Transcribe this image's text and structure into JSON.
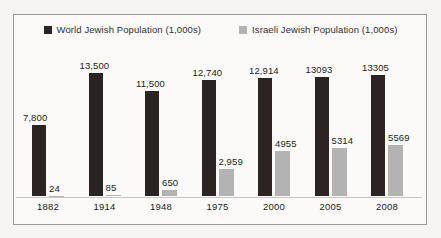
{
  "chart_data": {
    "type": "bar",
    "title": "",
    "xlabel": "",
    "ylabel": "",
    "grid": false,
    "legend_position": "top-center",
    "categories": [
      "1882",
      "1914",
      "1948",
      "1975",
      "2000",
      "2005",
      "2008"
    ],
    "ylim": [
      0,
      13500
    ],
    "series": [
      {
        "name": "World Jewish Population (1,000s)",
        "color": "#2b2422",
        "values": [
          7800,
          13500,
          11500,
          12740,
          12914,
          13093,
          13305
        ],
        "labels": [
          "7,800",
          "13,500",
          "11,500",
          "12,740",
          "12,914",
          "13093",
          "13305"
        ]
      },
      {
        "name": "Israeli Jewish Population (1,000s)",
        "color": "#b3b3b3",
        "values": [
          24,
          85,
          650,
          2959,
          4955,
          5314,
          5569
        ],
        "labels": [
          "24",
          "85",
          "650",
          "2,959",
          "4955",
          "5314",
          "5569"
        ]
      }
    ]
  },
  "legend": {
    "items": [
      {
        "label": "World Jewish Population (1,000s)",
        "swatch": "#2b2422",
        "icon": "square-swatch-dark"
      },
      {
        "label": "Israeli Jewish Population (1,000s)",
        "swatch": "#b3b3b3",
        "icon": "square-swatch-gray"
      }
    ]
  }
}
